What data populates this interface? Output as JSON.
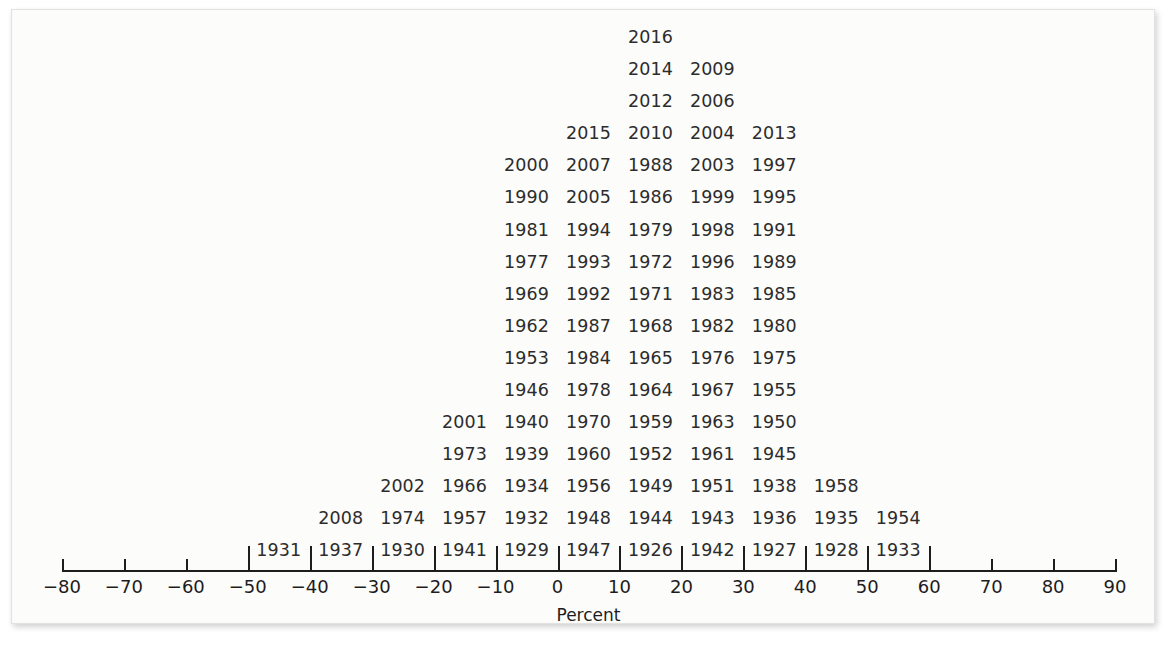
{
  "figure": {
    "kind": "stem-and-leaf style year dot plot",
    "axis_title": "Percent",
    "text_color": "#2c2c2c",
    "axis_color": "#1d1d1d",
    "background": "#fcfcfb"
  },
  "axis": {
    "label": "Percent",
    "min": -80,
    "max": 90,
    "tick_step": 10,
    "tick_labels": [
      "−80",
      "−70",
      "−60",
      "−50",
      "−40",
      "−30",
      "−20",
      "−10",
      "0",
      "10",
      "20",
      "30",
      "40",
      "50",
      "60",
      "70",
      "80",
      "90"
    ],
    "tick_values": [
      -80,
      -70,
      -60,
      -50,
      -40,
      -30,
      -20,
      -10,
      0,
      10,
      20,
      30,
      40,
      50,
      60,
      70,
      80,
      90
    ]
  },
  "chart_data": {
    "type": "bar",
    "title": "",
    "subtitle": "",
    "xlabel": "Percent",
    "ylabel": "",
    "xlim": [
      -80,
      90
    ],
    "grid": false,
    "legend": "none",
    "bin_width": 10,
    "note": "Each label is one observation (a year) stacked within its 10-percent bin; bin centers are plotted between axis ticks.",
    "categories": [
      "−50 to −40",
      "−40 to −30",
      "−30 to −20",
      "−20 to −10",
      "−10 to 0",
      "0 to 10",
      "10 to 20",
      "20 to 30",
      "30 to 40",
      "40 to 50",
      "50 to 60"
    ],
    "bin_centers": [
      -45,
      -35,
      -25,
      -15,
      -5,
      5,
      15,
      25,
      35,
      45,
      55
    ],
    "values": [
      1,
      2,
      3,
      4,
      7,
      16,
      19,
      19,
      17,
      12,
      3
    ],
    "bins": [
      {
        "center": -45,
        "range": [
          -50,
          -40
        ],
        "count": 1,
        "years": [
          "1931"
        ]
      },
      {
        "center": -35,
        "range": [
          -40,
          -30
        ],
        "count": 2,
        "years": [
          "2008",
          "1937"
        ]
      },
      {
        "center": -25,
        "range": [
          -30,
          -20
        ],
        "count": 3,
        "years": [
          "2002",
          "1974",
          "1930"
        ]
      },
      {
        "center": -15,
        "range": [
          -20,
          -10
        ],
        "count": 4,
        "years": [
          "2001",
          "1973",
          "1966",
          "1957"
        ]
      },
      {
        "center": -5,
        "range": [
          -10,
          0
        ],
        "count": 7,
        "years": [
          "2000",
          "1990",
          "1981",
          "1977",
          "1969",
          "1962",
          "1953",
          "1946",
          "1940",
          "1939",
          "1934",
          "1932",
          "1941"
        ]
      },
      {
        "center": 5,
        "range": [
          0,
          10
        ],
        "count": 16,
        "years": [
          "2015",
          "2007",
          "2005",
          "1994",
          "1993",
          "1992",
          "1987",
          "1984",
          "1978",
          "1970",
          "1960",
          "1956",
          "1948",
          "1929"
        ]
      },
      {
        "center": 15,
        "range": [
          10,
          20
        ],
        "count": 19,
        "years": [
          "2016",
          "2014",
          "2012",
          "2010",
          "1988",
          "1986",
          "1979",
          "1972",
          "1971",
          "1968",
          "1965",
          "1964",
          "1959",
          "1952",
          "1949",
          "1944",
          "1947"
        ]
      },
      {
        "center": 25,
        "range": [
          20,
          30
        ],
        "count": 19,
        "years": [
          "2009",
          "2006",
          "2004",
          "2003",
          "1999",
          "1998",
          "1996",
          "1983",
          "1982",
          "1976",
          "1967",
          "1963",
          "1961",
          "1951",
          "1943",
          "1926"
        ]
      },
      {
        "center": 35,
        "range": [
          30,
          40
        ],
        "count": 17,
        "years": [
          "2013",
          "1997",
          "1995",
          "1991",
          "1989",
          "1985",
          "1980",
          "1975",
          "1955",
          "1950",
          "1945",
          "1938",
          "1936",
          "1942"
        ]
      },
      {
        "center": 45,
        "range": [
          40,
          50
        ],
        "count": 12,
        "years": [
          "1958",
          "1935",
          "1927"
        ]
      },
      {
        "center": 55,
        "range": [
          50,
          60
        ],
        "count": 3,
        "years": [
          "1954",
          "1928"
        ]
      }
    ],
    "rows": [
      {
        "row": 1,
        "cells": [
          {
            "bin": 15,
            "year": "2016"
          }
        ]
      },
      {
        "row": 2,
        "cells": [
          {
            "bin": 15,
            "year": "2014"
          },
          {
            "bin": 25,
            "year": "2009"
          }
        ]
      },
      {
        "row": 3,
        "cells": [
          {
            "bin": 15,
            "year": "2012"
          },
          {
            "bin": 25,
            "year": "2006"
          }
        ]
      },
      {
        "row": 4,
        "cells": [
          {
            "bin": 5,
            "year": "2015"
          },
          {
            "bin": 15,
            "year": "2010"
          },
          {
            "bin": 25,
            "year": "2004"
          },
          {
            "bin": 35,
            "year": "2013"
          }
        ]
      },
      {
        "row": 5,
        "cells": [
          {
            "bin": -5,
            "year": "2000"
          },
          {
            "bin": 5,
            "year": "2007"
          },
          {
            "bin": 15,
            "year": "1988"
          },
          {
            "bin": 25,
            "year": "2003"
          },
          {
            "bin": 35,
            "year": "1997"
          }
        ]
      },
      {
        "row": 6,
        "cells": [
          {
            "bin": -5,
            "year": "1990"
          },
          {
            "bin": 5,
            "year": "2005"
          },
          {
            "bin": 15,
            "year": "1986"
          },
          {
            "bin": 25,
            "year": "1999"
          },
          {
            "bin": 35,
            "year": "1995"
          }
        ]
      },
      {
        "row": 7,
        "cells": [
          {
            "bin": -5,
            "year": "1981"
          },
          {
            "bin": 5,
            "year": "1994"
          },
          {
            "bin": 15,
            "year": "1979"
          },
          {
            "bin": 25,
            "year": "1998"
          },
          {
            "bin": 35,
            "year": "1991"
          }
        ]
      },
      {
        "row": 8,
        "cells": [
          {
            "bin": -5,
            "year": "1977"
          },
          {
            "bin": 5,
            "year": "1993"
          },
          {
            "bin": 15,
            "year": "1972"
          },
          {
            "bin": 25,
            "year": "1996"
          },
          {
            "bin": 35,
            "year": "1989"
          }
        ]
      },
      {
        "row": 9,
        "cells": [
          {
            "bin": -5,
            "year": "1969"
          },
          {
            "bin": 5,
            "year": "1992"
          },
          {
            "bin": 15,
            "year": "1971"
          },
          {
            "bin": 25,
            "year": "1983"
          },
          {
            "bin": 35,
            "year": "1985"
          }
        ]
      },
      {
        "row": 10,
        "cells": [
          {
            "bin": -5,
            "year": "1962"
          },
          {
            "bin": 5,
            "year": "1987"
          },
          {
            "bin": 15,
            "year": "1968"
          },
          {
            "bin": 25,
            "year": "1982"
          },
          {
            "bin": 35,
            "year": "1980"
          }
        ]
      },
      {
        "row": 11,
        "cells": [
          {
            "bin": -5,
            "year": "1953"
          },
          {
            "bin": 5,
            "year": "1984"
          },
          {
            "bin": 15,
            "year": "1965"
          },
          {
            "bin": 25,
            "year": "1976"
          },
          {
            "bin": 35,
            "year": "1975"
          }
        ]
      },
      {
        "row": 12,
        "cells": [
          {
            "bin": -5,
            "year": "1946"
          },
          {
            "bin": 5,
            "year": "1978"
          },
          {
            "bin": 15,
            "year": "1964"
          },
          {
            "bin": 25,
            "year": "1967"
          },
          {
            "bin": 35,
            "year": "1955"
          }
        ]
      },
      {
        "row": 13,
        "cells": [
          {
            "bin": -15,
            "year": "2001"
          },
          {
            "bin": -5,
            "year": "1940"
          },
          {
            "bin": 5,
            "year": "1970"
          },
          {
            "bin": 15,
            "year": "1959"
          },
          {
            "bin": 25,
            "year": "1963"
          },
          {
            "bin": 35,
            "year": "1950"
          }
        ]
      },
      {
        "row": 14,
        "cells": [
          {
            "bin": -15,
            "year": "1973"
          },
          {
            "bin": -5,
            "year": "1939"
          },
          {
            "bin": 5,
            "year": "1960"
          },
          {
            "bin": 15,
            "year": "1952"
          },
          {
            "bin": 25,
            "year": "1961"
          },
          {
            "bin": 35,
            "year": "1945"
          }
        ]
      },
      {
        "row": 15,
        "cells": [
          {
            "bin": -25,
            "year": "2002"
          },
          {
            "bin": -15,
            "year": "1966"
          },
          {
            "bin": -5,
            "year": "1934"
          },
          {
            "bin": 5,
            "year": "1956"
          },
          {
            "bin": 15,
            "year": "1949"
          },
          {
            "bin": 25,
            "year": "1951"
          },
          {
            "bin": 35,
            "year": "1938"
          },
          {
            "bin": 45,
            "year": "1958"
          }
        ]
      },
      {
        "row": 16,
        "cells": [
          {
            "bin": -35,
            "year": "2008"
          },
          {
            "bin": -25,
            "year": "1974"
          },
          {
            "bin": -15,
            "year": "1957"
          },
          {
            "bin": -5,
            "year": "1932"
          },
          {
            "bin": 5,
            "year": "1948"
          },
          {
            "bin": 15,
            "year": "1944"
          },
          {
            "bin": 25,
            "year": "1943"
          },
          {
            "bin": 35,
            "year": "1936"
          },
          {
            "bin": 45,
            "year": "1935"
          },
          {
            "bin": 55,
            "year": "1954"
          }
        ]
      },
      {
        "row": 17,
        "cells": [
          {
            "bin": -45,
            "year": "1931"
          },
          {
            "bin": -35,
            "year": "1937"
          },
          {
            "bin": -25,
            "year": "1930"
          },
          {
            "bin": -15,
            "year": "1941"
          },
          {
            "bin": -5,
            "year": "1929"
          },
          {
            "bin": 5,
            "year": "1947"
          },
          {
            "bin": 15,
            "year": "1926"
          },
          {
            "bin": 25,
            "year": "1942"
          },
          {
            "bin": 35,
            "year": "1927"
          },
          {
            "bin": 45,
            "year": "1928"
          },
          {
            "bin": 55,
            "year": "1933"
          }
        ]
      }
    ]
  }
}
